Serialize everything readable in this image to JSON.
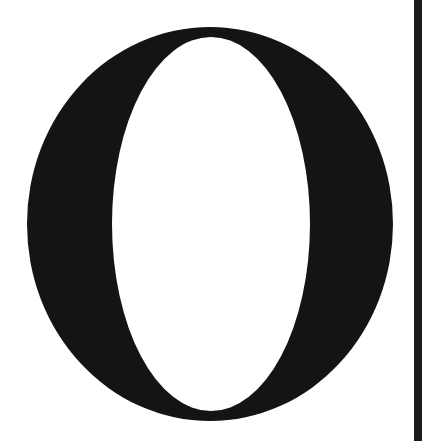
{
  "glyph": {
    "character": "O",
    "style": "serif capital letter",
    "color": "#141414",
    "outer": {
      "cx": 210,
      "cy": 224,
      "rx": 183,
      "ry": 197
    },
    "inner": {
      "cx": 211,
      "cy": 224,
      "rx": 99,
      "ry": 187
    }
  },
  "side_bar": {
    "color": "#1a1a1a"
  },
  "background": "#ffffff"
}
